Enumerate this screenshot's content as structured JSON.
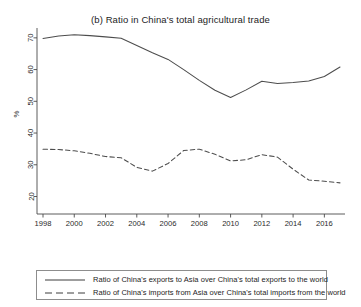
{
  "chart_data": {
    "type": "line",
    "title": "(b) Ratio in China's total agricultural trade",
    "xlabel": "",
    "ylabel": "%",
    "xlim": [
      1998,
      2017
    ],
    "ylim": [
      20,
      72
    ],
    "grid": false,
    "legend_position": "bottom",
    "xticks": [
      1998,
      2000,
      2002,
      2004,
      2006,
      2008,
      2010,
      2012,
      2014,
      2016
    ],
    "yticks": [
      20,
      30,
      40,
      50,
      60,
      70
    ],
    "x": [
      1998,
      1999,
      2000,
      2001,
      2002,
      2003,
      2004,
      2005,
      2006,
      2007,
      2008,
      2009,
      2010,
      2011,
      2012,
      2013,
      2014,
      2015,
      2016,
      2017
    ],
    "series": [
      {
        "name": "Ratio of China's exports to Asia over China's total exports to the world",
        "style": "solid",
        "color": "#4d4d4d",
        "values": [
          69.8,
          70.6,
          71.0,
          70.7,
          70.3,
          69.9,
          67.6,
          65.3,
          63.2,
          60.0,
          56.6,
          53.5,
          51.2,
          53.6,
          56.3,
          55.6,
          55.9,
          56.4,
          57.8,
          60.8
        ]
      },
      {
        "name": "Ratio of China's imports from Asia over China's total imports from the world",
        "style": "dashed",
        "color": "#4d4d4d",
        "values": [
          34.9,
          34.8,
          34.4,
          33.6,
          32.6,
          32.2,
          29.2,
          28.0,
          30.4,
          34.5,
          34.9,
          33.3,
          31.2,
          31.6,
          33.2,
          32.4,
          28.6,
          25.2,
          24.8,
          24.3
        ]
      }
    ]
  },
  "legend": {
    "items": [
      {
        "label": "Ratio of China's exports to Asia over China's total exports to the world",
        "style": "solid"
      },
      {
        "label": "Ratio of China's imports from Asia over China's total imports from the world",
        "style": "dashed"
      }
    ]
  }
}
